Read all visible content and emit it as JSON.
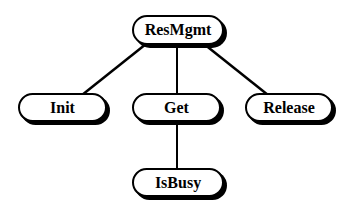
{
  "diagram": {
    "type": "tree",
    "nodes": [
      {
        "id": "resmgmt",
        "label": "ResMgmt"
      },
      {
        "id": "init",
        "label": "Init"
      },
      {
        "id": "get",
        "label": "Get"
      },
      {
        "id": "release",
        "label": "Release"
      },
      {
        "id": "isbusy",
        "label": "IsBusy"
      }
    ],
    "edges": [
      {
        "from": "ResMgmt",
        "to": "Init"
      },
      {
        "from": "ResMgmt",
        "to": "Get"
      },
      {
        "from": "ResMgmt",
        "to": "Release"
      },
      {
        "from": "Get",
        "to": "IsBusy"
      }
    ]
  }
}
